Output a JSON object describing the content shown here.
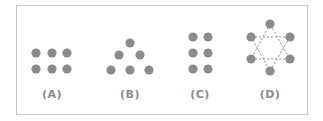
{
  "figure": {
    "dot_color": "#8c8c8c",
    "line_color": "#8c8c8c",
    "panels": [
      {
        "id": "A",
        "label": "(A)",
        "label_x": 52,
        "dots": [
          [
            36,
            53
          ],
          [
            52,
            53
          ],
          [
            67,
            53
          ],
          [
            36,
            69
          ],
          [
            52,
            69
          ],
          [
            67,
            69
          ]
        ]
      },
      {
        "id": "B",
        "label": "(B)",
        "label_x": 130,
        "dots": [
          [
            130,
            43
          ],
          [
            119,
            55
          ],
          [
            140,
            55
          ],
          [
            111,
            70
          ],
          [
            130,
            70
          ],
          [
            149,
            70
          ]
        ]
      },
      {
        "id": "C",
        "label": "(C)",
        "label_x": 200,
        "dots": [
          [
            193,
            37
          ],
          [
            208,
            37
          ],
          [
            193,
            53
          ],
          [
            208,
            53
          ],
          [
            193,
            69
          ],
          [
            208,
            69
          ]
        ]
      },
      {
        "id": "D",
        "label": "(D)",
        "label_x": 270,
        "dots": [
          [
            270,
            24
          ],
          [
            251,
            37
          ],
          [
            290,
            37
          ],
          [
            251,
            59
          ],
          [
            290,
            59
          ],
          [
            270,
            71
          ]
        ],
        "dashed_triangles": [
          [
            [
              251,
              37
            ],
            [
              290,
              37
            ],
            [
              270,
              71
            ]
          ],
          [
            [
              270,
              24
            ],
            [
              251,
              59
            ],
            [
              290,
              59
            ]
          ]
        ]
      }
    ]
  }
}
